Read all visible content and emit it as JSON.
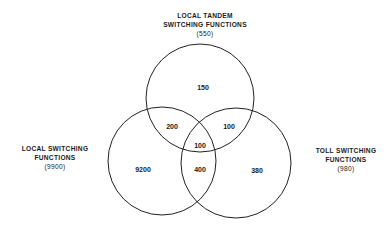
{
  "diagram": {
    "type": "venn",
    "sets": [
      {
        "id": "tandem",
        "title_lines": [
          "LOCAL TANDEM",
          "SWITCHING FUNCTIONS"
        ],
        "total": "(550)"
      },
      {
        "id": "local",
        "title_lines": [
          "LOCAL SWITCHING",
          "FUNCTIONS"
        ],
        "total": "(9900)"
      },
      {
        "id": "toll",
        "title_lines": [
          "TOLL SWITCHING",
          "FUNCTIONS"
        ],
        "total": "(980)"
      }
    ],
    "regions": {
      "tandem_only": "150",
      "local_tandem": "200",
      "tandem_toll": "100",
      "all_three": "100",
      "local_only": "9200",
      "local_toll": "400",
      "toll_only": "380"
    },
    "stroke_color": "#222222",
    "background": "#ffffff"
  }
}
